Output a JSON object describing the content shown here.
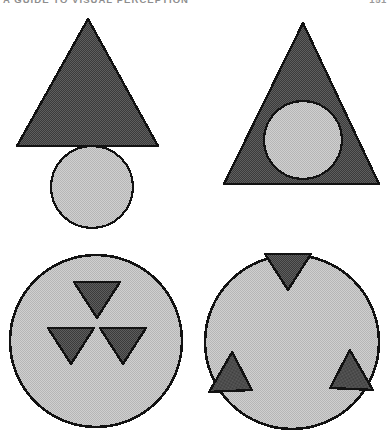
{
  "page": {
    "running_head": {
      "title": "A GUIDE TO VISUAL PERCEPTION",
      "page_number": "151"
    },
    "background_color": "#ffffff"
  },
  "figure": {
    "name": "figure-ground-shape-overlap-plate",
    "colors": {
      "dark_fill": "#4f4f4f",
      "light_fill": "#c6c6c6",
      "outline": "#111111",
      "background": "#ffffff"
    },
    "panels": [
      {
        "id": "panel-top-left",
        "label": "Triangle above circle (separated)",
        "shapes": [
          {
            "type": "triangle",
            "fill": "dark",
            "apex_x": 88,
            "apex_y": 19,
            "base_y": 146,
            "base_left_x": 17,
            "base_right_x": 158,
            "rotation_deg": 0
          },
          {
            "type": "circle",
            "fill": "light",
            "cx": 92,
            "cy": 187,
            "r": 41
          }
        ]
      },
      {
        "id": "panel-top-right",
        "label": "Circle inscribed within triangle",
        "shapes": [
          {
            "type": "triangle",
            "fill": "dark",
            "apex_x": 303,
            "apex_y": 23,
            "base_y": 184,
            "base_left_x": 224,
            "base_right_x": 379,
            "rotation_deg": 0
          },
          {
            "type": "circle",
            "fill": "light",
            "cx": 303,
            "cy": 140,
            "r": 39
          }
        ]
      },
      {
        "id": "panel-bottom-left",
        "label": "Large circle with three clustered triangles at centre",
        "shapes": [
          {
            "type": "circle",
            "fill": "light",
            "cx": 96,
            "cy": 341,
            "r": 86
          },
          {
            "type": "triangle",
            "fill": "dark",
            "cx": 97,
            "cy": 302,
            "size": 47,
            "rotation_deg": 180
          },
          {
            "type": "triangle",
            "fill": "dark",
            "cx": 71,
            "cy": 348,
            "size": 47,
            "rotation_deg": 180
          },
          {
            "type": "triangle",
            "fill": "dark",
            "cx": 123,
            "cy": 348,
            "size": 47,
            "rotation_deg": 180
          }
        ]
      },
      {
        "id": "panel-bottom-right",
        "label": "Large circle with three triangles spread to the rim",
        "shapes": [
          {
            "type": "circle",
            "fill": "light",
            "cx": 292,
            "cy": 342,
            "r": 87
          },
          {
            "type": "triangle",
            "fill": "dark",
            "cx": 288,
            "cy": 274,
            "size": 47,
            "rotation_deg": 180
          },
          {
            "type": "triangle",
            "fill": "dark",
            "cx": 238,
            "cy": 382,
            "size": 47,
            "rotation_deg": 120
          },
          {
            "type": "triangle",
            "fill": "dark",
            "cx": 344,
            "cy": 380,
            "size": 47,
            "rotation_deg": 240
          }
        ]
      }
    ]
  }
}
